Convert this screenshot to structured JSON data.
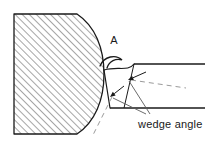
{
  "figure": {
    "background_color": "#ffffff",
    "line_color": "#1a1a1a",
    "hatch_color": "#3a3a3a",
    "leader_color": "#5a5a5a",
    "dashed_color": "#9a9a9a",
    "text_color": "#1a1a1a"
  },
  "labels": {
    "detail_marker": "A",
    "wedge_angle": "wedge angle"
  },
  "workpiece": {
    "name": "workpiece",
    "fill": "none",
    "hatch_angle_deg": 45,
    "hatch_spacing_px": 5,
    "outline": "M 14,14 L 77,14 C 95,26 104,48 104,74 C 104,100 95,122 77,134 L 14,134 Z"
  },
  "tool": {
    "name": "cutting-tool",
    "rake_face": "M 104,70 C 118,66 128,72 134,64",
    "flank_face": "M 104,70 L 110,108",
    "shank_top": "M 134,64 L 205,64",
    "shank_bottom": "M 110,108 L 205,108",
    "wedge_back_edge": "M 134,64 L 124,108"
  },
  "chip": {
    "name": "chip-curl",
    "path": "M 100,66 C 104,56 116,54 122,60 C 116,58 109,61 107,68"
  },
  "annotations": {
    "arrow_upper": {
      "name": "wedge-angle-arrow-upper",
      "tip_x": 128,
      "tip_y": 80,
      "from_x": 146,
      "from_y": 72
    },
    "arrow_lower": {
      "name": "wedge-angle-arrow-lower",
      "tip_x": 110,
      "tip_y": 97,
      "from_x": 124,
      "from_y": 86
    },
    "leader_upper": "M 150,114 L 129,81",
    "leader_lower": "M 146,114 L 113,98",
    "dashed_upper": "M 131,80 L 186,88",
    "dashed_lower": "M 112,97 L 92,137"
  },
  "text_positions": {
    "detail_marker": {
      "x": 114,
      "y": 44
    },
    "wedge_angle": {
      "x": 138,
      "y": 128
    }
  }
}
